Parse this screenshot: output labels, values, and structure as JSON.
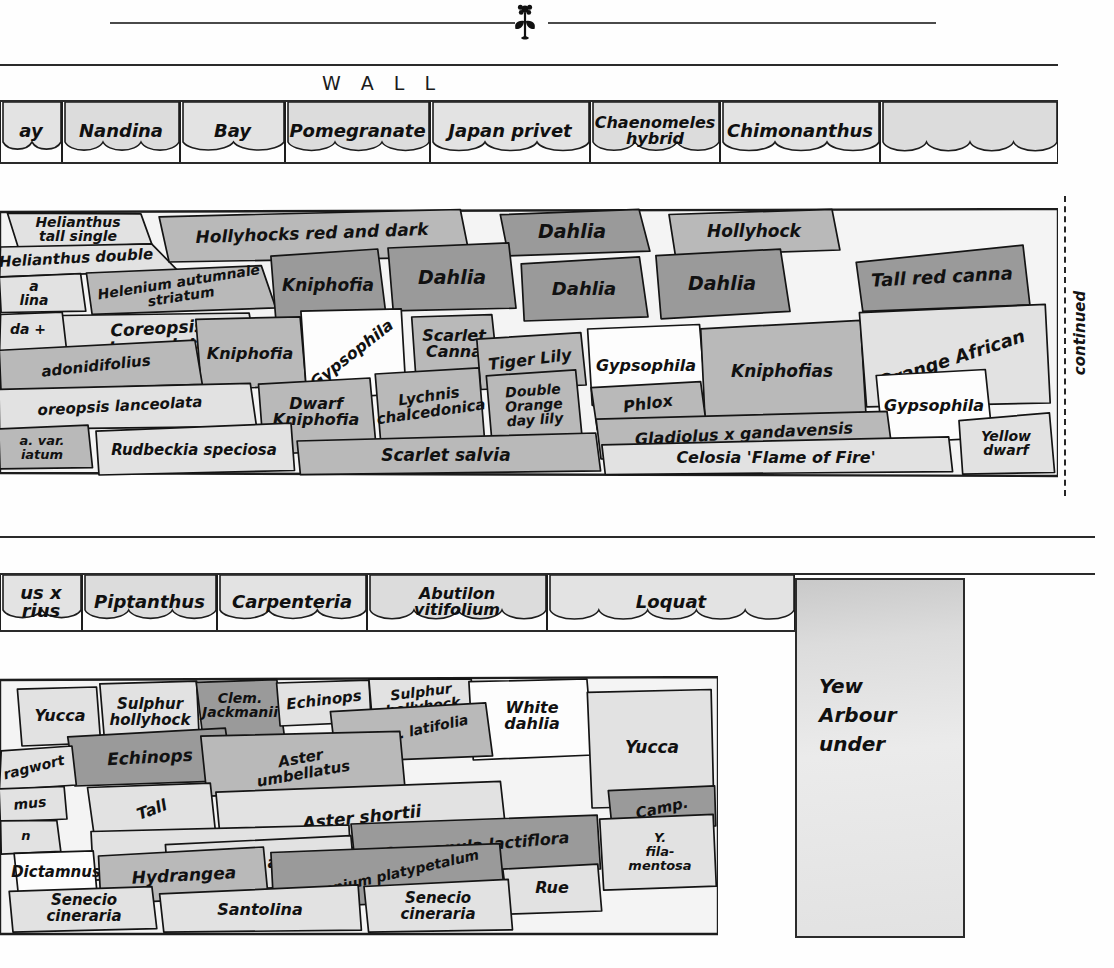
{
  "header": {
    "ornament_icon": "flower-ornament",
    "rule_left_icon": "horizontal-rule",
    "rule_right_icon": "horizontal-rule"
  },
  "upper_wall": {
    "wall_label": "W A L L",
    "shrubs": [
      {
        "label": "ay",
        "clipped": true
      },
      {
        "label": "Nandina"
      },
      {
        "label": "Bay"
      },
      {
        "label": "Pomegranate"
      },
      {
        "label": "Japan privet"
      },
      {
        "label": "Chaenomeles\nhybrid"
      },
      {
        "label": "Chimonanthus"
      },
      {
        "label": ""
      }
    ]
  },
  "main_border": {
    "continued_note": "continued",
    "cells": [
      {
        "label": "Helianthus\ntall single",
        "tone": "light"
      },
      {
        "label": "Helianthus double",
        "tone": "light"
      },
      {
        "label": "a\nlina",
        "tone": "light",
        "clipped": true
      },
      {
        "label": "Helenium autumnale\nstriatum",
        "tone": "mid"
      },
      {
        "label": "Hollyhocks red and dark",
        "tone": "mid"
      },
      {
        "label": "Dahlia",
        "tone": "dark"
      },
      {
        "label": "Hollyhock",
        "tone": "mid"
      },
      {
        "label": "Tall red canna",
        "tone": "dark"
      },
      {
        "label": "Kniphofia",
        "tone": "dark"
      },
      {
        "label": "Dahlia",
        "tone": "dark"
      },
      {
        "label": "Dahlia",
        "tone": "dark"
      },
      {
        "label": "Dahlia",
        "tone": "dark"
      },
      {
        "label": "Coreopsis\nlanceolata",
        "tone": "light"
      },
      {
        "label": "Kniphofia",
        "tone": "mid"
      },
      {
        "label": "Gypsophila",
        "tone": "white"
      },
      {
        "label": "Scarlet\nCanna",
        "tone": "mid"
      },
      {
        "label": "Tiger Lily",
        "tone": "mid"
      },
      {
        "label": "Gypsophila",
        "tone": "white"
      },
      {
        "label": "Kniphofias",
        "tone": "mid"
      },
      {
        "label": "Orange African",
        "tone": "light"
      },
      {
        "label": "da +",
        "tone": "light",
        "clipped": true
      },
      {
        "label": "adonidifolius",
        "tone": "mid"
      },
      {
        "label": "Dwarf\nKniphofia",
        "tone": "mid"
      },
      {
        "label": "Lychnis\nchalcedonica",
        "tone": "mid"
      },
      {
        "label": "Double\nOrange\nday lily",
        "tone": "mid"
      },
      {
        "label": "Phlox",
        "tone": "mid"
      },
      {
        "label": "Gypsophila",
        "tone": "white"
      },
      {
        "label": "oreopsis lanceolata",
        "tone": "light",
        "clipped": true
      },
      {
        "label": "Gladiolus x gandavensis",
        "tone": "mid"
      },
      {
        "label": "a. var.\niatum",
        "tone": "mid",
        "clipped": true
      },
      {
        "label": "Rudbeckia speciosa",
        "tone": "light"
      },
      {
        "label": "Scarlet salvia",
        "tone": "mid"
      },
      {
        "label": "Celosia 'Flame of Fire'",
        "tone": "light"
      },
      {
        "label": "Yellow\ndwarf",
        "tone": "light"
      }
    ]
  },
  "lower_wall": {
    "shrubs": [
      {
        "label": "us x\nrius",
        "clipped": true
      },
      {
        "label": "Piptanthus"
      },
      {
        "label": "Carpenteria"
      },
      {
        "label": "Abutilon\nvitifolium"
      },
      {
        "label": "Loquat"
      }
    ]
  },
  "lower_border": {
    "cells": [
      {
        "label": "Yucca",
        "tone": "light"
      },
      {
        "label": "Sulphur\nhollyhock",
        "tone": "light"
      },
      {
        "label": "Clem.\nJackmanii",
        "tone": "dark"
      },
      {
        "label": "Echinops",
        "tone": "light"
      },
      {
        "label": "Sulphur\nhollyhock",
        "tone": "light"
      },
      {
        "label": "White\ndahlia",
        "tone": "white"
      },
      {
        "label": "Yucca",
        "tone": "light"
      },
      {
        "label": "Echinops",
        "tone": "dark"
      },
      {
        "label": "White\ndahlia",
        "tone": "white"
      },
      {
        "label": "Camp. latifolia",
        "tone": "mid"
      },
      {
        "label": "Aster\numbellatus",
        "tone": "mid"
      },
      {
        "label": "ragwort",
        "tone": "light",
        "clipped": true
      },
      {
        "label": "mus",
        "tone": "light",
        "clipped": true
      },
      {
        "label": "Tall",
        "tone": "light"
      },
      {
        "label": "Aster shortii",
        "tone": "light"
      },
      {
        "label": "Camp.",
        "tone": "dark",
        "clipped": true
      },
      {
        "label": "n",
        "tone": "light",
        "clipped": true
      },
      {
        "label": "yellow snapdragon",
        "tone": "light"
      },
      {
        "label": "Campanula lactiflora",
        "tone": "dark"
      },
      {
        "label": "Aster acris",
        "tone": "light"
      },
      {
        "label": "Y.\nfila-\nmentosa",
        "tone": "light"
      },
      {
        "label": "Dictamnus",
        "tone": "white"
      },
      {
        "label": "Hydrangea",
        "tone": "mid"
      },
      {
        "label": "Geranium platypetalum",
        "tone": "dark"
      },
      {
        "label": "Rue",
        "tone": "light"
      },
      {
        "label": "Senecio\ncineraria",
        "tone": "light"
      },
      {
        "label": "Santolina",
        "tone": "light"
      },
      {
        "label": "Senecio\ncineraria",
        "tone": "light"
      }
    ]
  },
  "arbour": {
    "label": "Yew\nArbour\nunder"
  },
  "colors": {
    "ink": "#131313",
    "rule": "#4a4a4a",
    "white": "#fdfdfd",
    "light": "#e2e2e2",
    "mid": "#b9b9b9",
    "dark": "#9a9a9a"
  }
}
